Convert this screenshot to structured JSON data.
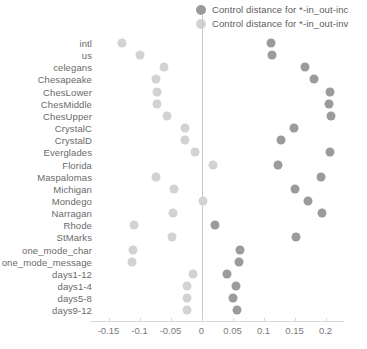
{
  "chart_data": {
    "type": "scatter",
    "title": "",
    "subtitle": "",
    "xlabel": "",
    "ylabel": "",
    "grid": false,
    "legend_position": "top-right",
    "xlim": [
      -0.175,
      0.23
    ],
    "xticks": [
      -0.15,
      -0.1,
      -0.05,
      0,
      0.05,
      0.1,
      0.15,
      0.2
    ],
    "xticklabels": [
      "-0.15",
      "-0.1",
      "-0.05",
      "0",
      "0.05",
      "0.1",
      "0.15",
      "0.2"
    ],
    "categories": [
      "intl",
      "us",
      "celegans",
      "Chesapeake",
      "ChesLower",
      "ChesMiddle",
      "ChesUpper",
      "CrystalC",
      "CrystalD",
      "Everglades",
      "Florida",
      "Maspalomas",
      "Michigan",
      "Mondego",
      "Narragan",
      "Rhode",
      "StMarks",
      "one_mode_char",
      "one_mode_message",
      "days1-12",
      "days1-4",
      "days5-8",
      "days9-12"
    ],
    "series": [
      {
        "name": "Control distance for *-in_out-inc",
        "color": "#9b9b9b",
        "values": [
          0.112,
          0.114,
          0.167,
          0.182,
          0.208,
          0.205,
          0.209,
          0.149,
          0.128,
          0.207,
          0.124,
          0.192,
          0.151,
          0.172,
          0.194,
          0.021,
          0.152,
          0.062,
          0.061,
          0.041,
          0.056,
          0.051,
          0.058
        ]
      },
      {
        "name": "Control distance for *-in_out-inv",
        "color": "#d2d2d2",
        "values": [
          -0.128,
          -0.099,
          -0.061,
          -0.074,
          -0.071,
          -0.072,
          -0.055,
          -0.026,
          -0.027,
          -0.01,
          0.019,
          -0.073,
          -0.044,
          0.003,
          -0.046,
          -0.109,
          -0.047,
          -0.11,
          -0.112,
          -0.013,
          -0.023,
          -0.024,
          -0.024
        ]
      }
    ]
  },
  "legend": {
    "items": [
      {
        "label": "Control distance for *-in_out-inc",
        "color": "#9b9b9b"
      },
      {
        "label": "Control distance for *-in_out-inv",
        "color": "#d2d2d2"
      }
    ]
  },
  "colors": {
    "inc": "#9b9b9b",
    "inv": "#d2d2d2",
    "axis": "#d8d8d8",
    "zero_line": "#c9c9c9",
    "text": "#6a6a6a",
    "background": "#ffffff"
  }
}
